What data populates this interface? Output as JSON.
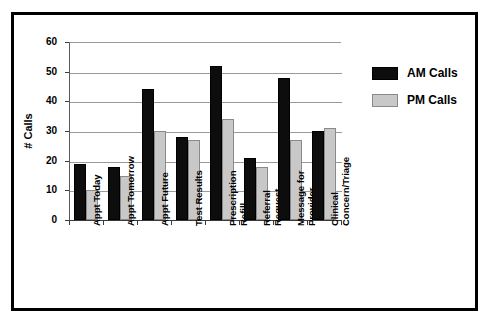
{
  "chart_data": {
    "type": "bar",
    "title": "",
    "xlabel": "",
    "ylabel": "# Calls",
    "ylim": [
      0,
      60
    ],
    "yticks": [
      0,
      10,
      20,
      30,
      40,
      50,
      60
    ],
    "ytick_labels": [
      "0",
      "10",
      "20",
      "30",
      "40",
      "50",
      "60"
    ],
    "grid": "horizontal",
    "legend_position": "right",
    "categories": [
      "Appt Today",
      "Appt Tomorrow",
      "Appt Future",
      "Test Results",
      "Prescription\nRefill",
      "Referral\nRequest",
      "Message for\nProvider",
      "Clinical\nConcern/Triage"
    ],
    "series": [
      {
        "name": "AM Calls",
        "color": "#0d0d0d",
        "values": [
          19,
          18,
          44,
          28,
          52,
          21,
          48,
          30
        ]
      },
      {
        "name": "PM Calls",
        "color": "#c8c8c8",
        "values": [
          10,
          15,
          30,
          27,
          34,
          18,
          27,
          31
        ]
      }
    ]
  },
  "legend": {
    "entries": [
      {
        "label": "AM Calls",
        "swatch": "am"
      },
      {
        "label": "PM Calls",
        "swatch": "pm"
      }
    ]
  },
  "axis": {
    "y_title": "# Calls"
  }
}
